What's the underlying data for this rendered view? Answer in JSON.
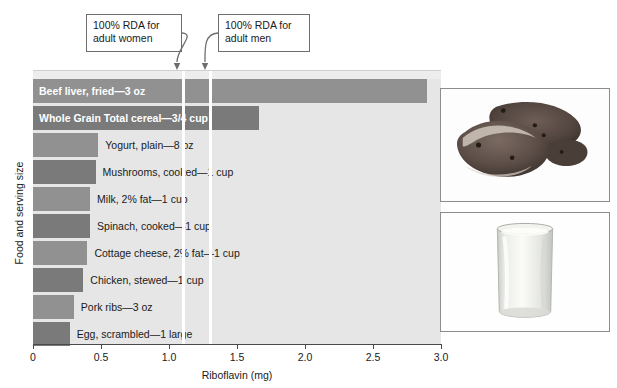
{
  "chart_data": {
    "type": "bar",
    "orientation": "horizontal",
    "title": "",
    "xlabel": "Riboflavin (mg)",
    "ylabel": "Food and serving size",
    "xlim": [
      0,
      3.0
    ],
    "xticks": [
      "0",
      "0.5",
      "1.0",
      "1.5",
      "2.0",
      "2.5",
      "3.0"
    ],
    "xtick_values": [
      0,
      0.5,
      1.0,
      1.5,
      2.0,
      2.5,
      3.0
    ],
    "grid": false,
    "legend": "none",
    "categories": [
      "Beef liver, fried—3 oz",
      "Whole Grain Total cereal—3/4 cup",
      "Yogurt, plain—8 oz",
      "Mushrooms, cooked—1 cup",
      "Milk, 2% fat—1 cup",
      "Spinach, cooked—1 cup",
      "Cottage cheese, 2% fat—1 cup",
      "Chicken, stewed—1 cup",
      "Pork ribs—3 oz",
      "Egg, scrambled—1 large"
    ],
    "values": [
      2.9,
      1.66,
      0.48,
      0.46,
      0.42,
      0.42,
      0.4,
      0.37,
      0.3,
      0.27
    ],
    "bars": [
      {
        "label": "Beef liver, fried—3 oz",
        "value": 2.9,
        "color": "#919191",
        "label_inside": true
      },
      {
        "label": "Whole Grain Total cereal—3/4 cup",
        "value": 1.66,
        "color": "#7a7a7a",
        "label_inside": true
      },
      {
        "label": "Yogurt, plain—8 oz",
        "value": 0.48,
        "color": "#919191",
        "label_inside": false
      },
      {
        "label": "Mushrooms, cooked—1 cup",
        "value": 0.46,
        "color": "#7a7a7a",
        "label_inside": false
      },
      {
        "label": "Milk, 2% fat—1 cup",
        "value": 0.42,
        "color": "#919191",
        "label_inside": false
      },
      {
        "label": "Spinach, cooked—1 cup",
        "value": 0.42,
        "color": "#7a7a7a",
        "label_inside": false
      },
      {
        "label": "Cottage cheese, 2% fat—1 cup",
        "value": 0.4,
        "color": "#919191",
        "label_inside": false
      },
      {
        "label": "Chicken, stewed—1 cup",
        "value": 0.37,
        "color": "#7a7a7a",
        "label_inside": false
      },
      {
        "label": "Pork ribs—3 oz",
        "value": 0.3,
        "color": "#919191",
        "label_inside": false
      },
      {
        "label": "Egg, scrambled—1 large",
        "value": 0.27,
        "color": "#7a7a7a",
        "label_inside": false
      }
    ],
    "reference_lines": [
      {
        "name": "women",
        "value": 1.1,
        "label": "100% RDA for\nadult women",
        "color": "#ffffff"
      },
      {
        "name": "men",
        "value": 1.3,
        "label": "100% RDA for\nadult men",
        "color": "#ffffff"
      }
    ],
    "annotations": [
      {
        "name": "callout-women",
        "text": "100% RDA for\nadult women"
      },
      {
        "name": "callout-men",
        "text": "100% RDA for\nadult men"
      }
    ]
  },
  "insets": [
    {
      "name": "beef-liver-photo",
      "alt": "Fried beef liver slices"
    },
    {
      "name": "milk-glass-photo",
      "alt": "Glass of milk"
    }
  ],
  "colors": {
    "bar_light": "#919191",
    "bar_dark": "#7a7a7a",
    "plot_background": "#e6e6e6",
    "rda_line": "#ffffff",
    "axis": "#4a4a4a"
  }
}
